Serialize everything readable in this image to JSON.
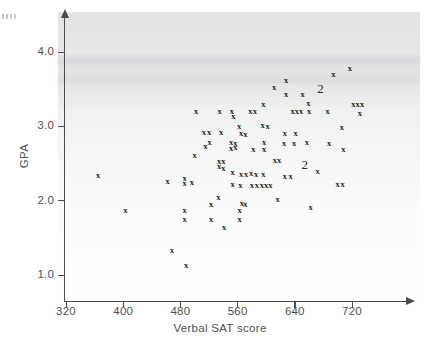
{
  "figure": {
    "kind": "scatterplot",
    "marker_glyph": "x",
    "duplicate_glyph": "2",
    "ink_color": "#1d1d20",
    "axis_color": "#4a4a4f"
  },
  "chart_data": {
    "type": "scatter",
    "title": "",
    "xlabel": "Verbal SAT score",
    "ylabel": "GPA",
    "xlim": [
      320,
      780
    ],
    "ylim": [
      0.85,
      4.35
    ],
    "xticks": [
      320,
      400,
      480,
      560,
      640,
      720
    ],
    "yticks": [
      "1.0",
      "2.0",
      "3.0",
      "4.0"
    ],
    "xtick_labels": [
      "320",
      "400",
      "480",
      "560",
      "640",
      "720"
    ],
    "ytick_labels": [
      "1.0",
      "2.0",
      "3.0",
      "4.0"
    ],
    "grid": false,
    "legend": null,
    "marker": "x",
    "annotations": [
      {
        "label": "2",
        "x": 676,
        "y": 3.52,
        "meaning": "two coincident observations"
      },
      {
        "label": "2",
        "x": 654,
        "y": 2.5,
        "meaning": "two coincident observations"
      }
    ],
    "points": [
      {
        "x": 365,
        "y": 2.35
      },
      {
        "x": 403,
        "y": 1.87
      },
      {
        "x": 462,
        "y": 2.26
      },
      {
        "x": 468,
        "y": 1.33
      },
      {
        "x": 486,
        "y": 2.3
      },
      {
        "x": 486,
        "y": 2.24
      },
      {
        "x": 486,
        "y": 1.87
      },
      {
        "x": 486,
        "y": 1.76
      },
      {
        "x": 488,
        "y": 1.13
      },
      {
        "x": 496,
        "y": 2.25
      },
      {
        "x": 502,
        "y": 3.2
      },
      {
        "x": 500,
        "y": 2.62
      },
      {
        "x": 513,
        "y": 2.93
      },
      {
        "x": 520,
        "y": 2.92
      },
      {
        "x": 515,
        "y": 2.74
      },
      {
        "x": 521,
        "y": 2.79
      },
      {
        "x": 523,
        "y": 1.96
      },
      {
        "x": 523,
        "y": 1.75
      },
      {
        "x": 533,
        "y": 2.05
      },
      {
        "x": 535,
        "y": 3.21
      },
      {
        "x": 537,
        "y": 2.92
      },
      {
        "x": 534,
        "y": 2.47
      },
      {
        "x": 540,
        "y": 2.44
      },
      {
        "x": 534,
        "y": 2.54
      },
      {
        "x": 540,
        "y": 2.53
      },
      {
        "x": 541,
        "y": 1.64
      },
      {
        "x": 552,
        "y": 3.21
      },
      {
        "x": 554,
        "y": 3.14
      },
      {
        "x": 551,
        "y": 2.79
      },
      {
        "x": 557,
        "y": 2.78
      },
      {
        "x": 551,
        "y": 2.71
      },
      {
        "x": 557,
        "y": 2.72
      },
      {
        "x": 553,
        "y": 2.39
      },
      {
        "x": 553,
        "y": 2.22
      },
      {
        "x": 562,
        "y": 3.01
      },
      {
        "x": 565,
        "y": 2.91
      },
      {
        "x": 571,
        "y": 2.9
      },
      {
        "x": 565,
        "y": 2.36
      },
      {
        "x": 572,
        "y": 2.36
      },
      {
        "x": 564,
        "y": 2.21
      },
      {
        "x": 571,
        "y": 1.95
      },
      {
        "x": 566,
        "y": 1.97
      },
      {
        "x": 563,
        "y": 1.87
      },
      {
        "x": 563,
        "y": 1.75
      },
      {
        "x": 578,
        "y": 3.21
      },
      {
        "x": 584,
        "y": 3.21
      },
      {
        "x": 582,
        "y": 2.7
      },
      {
        "x": 579,
        "y": 2.37
      },
      {
        "x": 586,
        "y": 2.36
      },
      {
        "x": 580,
        "y": 2.21
      },
      {
        "x": 587,
        "y": 2.21
      },
      {
        "x": 596,
        "y": 3.3
      },
      {
        "x": 595,
        "y": 3.02
      },
      {
        "x": 602,
        "y": 3.01
      },
      {
        "x": 597,
        "y": 2.79
      },
      {
        "x": 597,
        "y": 2.7
      },
      {
        "x": 596,
        "y": 2.36
      },
      {
        "x": 594,
        "y": 2.21
      },
      {
        "x": 600,
        "y": 2.21
      },
      {
        "x": 606,
        "y": 2.21
      },
      {
        "x": 611,
        "y": 3.53
      },
      {
        "x": 612,
        "y": 2.55
      },
      {
        "x": 618,
        "y": 2.55
      },
      {
        "x": 616,
        "y": 2.02
      },
      {
        "x": 628,
        "y": 3.62
      },
      {
        "x": 628,
        "y": 3.43
      },
      {
        "x": 626,
        "y": 2.91
      },
      {
        "x": 625,
        "y": 2.78
      },
      {
        "x": 626,
        "y": 2.33
      },
      {
        "x": 637,
        "y": 3.21
      },
      {
        "x": 643,
        "y": 3.21
      },
      {
        "x": 649,
        "y": 3.21
      },
      {
        "x": 641,
        "y": 2.91
      },
      {
        "x": 639,
        "y": 2.78
      },
      {
        "x": 634,
        "y": 2.33
      },
      {
        "x": 651,
        "y": 3.43
      },
      {
        "x": 659,
        "y": 3.31
      },
      {
        "x": 660,
        "y": 3.21
      },
      {
        "x": 657,
        "y": 2.79
      },
      {
        "x": 662,
        "y": 1.92
      },
      {
        "x": 672,
        "y": 2.4
      },
      {
        "x": 686,
        "y": 3.21
      },
      {
        "x": 688,
        "y": 2.78
      },
      {
        "x": 694,
        "y": 3.71
      },
      {
        "x": 706,
        "y": 2.99
      },
      {
        "x": 708,
        "y": 2.7
      },
      {
        "x": 700,
        "y": 2.22
      },
      {
        "x": 707,
        "y": 2.22
      },
      {
        "x": 717,
        "y": 3.79
      },
      {
        "x": 722,
        "y": 3.3
      },
      {
        "x": 728,
        "y": 3.3
      },
      {
        "x": 734,
        "y": 3.3
      },
      {
        "x": 731,
        "y": 3.18
      }
    ]
  }
}
